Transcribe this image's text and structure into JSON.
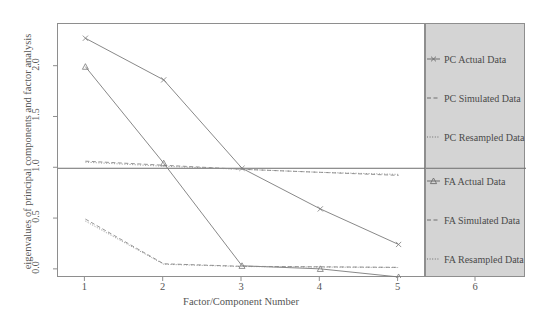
{
  "chart_data": {
    "type": "line",
    "title": "",
    "xlabel": "Factor/Component Number",
    "ylabel": "eigenvalues of principal components and factor analysis",
    "xlim": [
      0.65,
      5.35
    ],
    "ylim": [
      -0.08,
      2.42
    ],
    "xticks": [
      1,
      2,
      3,
      4,
      5
    ],
    "xtick_labels": [
      "1",
      "2",
      "3",
      "4",
      "5"
    ],
    "legend_axis_tick": "6",
    "yticks": [
      0.0,
      0.5,
      1.0,
      1.5,
      2.0
    ],
    "ytick_labels": [
      "0.0",
      "0.5",
      "1.0",
      "1.5",
      "2.0"
    ],
    "grid": false,
    "reference_line": {
      "y": 1.0,
      "style": "solid",
      "color": "#6e6e6e"
    },
    "legend_position": "right",
    "x": [
      1,
      2,
      3,
      4,
      5
    ],
    "series": [
      {
        "name": "PC Actual Data",
        "values": [
          2.28,
          1.87,
          1.0,
          0.6,
          0.25
        ],
        "marker": "x",
        "style": "solid",
        "color": "#7a7a7a"
      },
      {
        "name": "PC Simulated Data",
        "values": [
          1.07,
          1.03,
          0.99,
          0.96,
          0.93
        ],
        "marker": "none",
        "style": "dashed",
        "color": "#8a8a8a"
      },
      {
        "name": "PC Resampled Data",
        "values": [
          1.06,
          1.02,
          0.99,
          0.96,
          0.94
        ],
        "marker": "none",
        "style": "dotted",
        "color": "#8a8a8a"
      },
      {
        "name": "FA Actual Data",
        "values": [
          2.0,
          1.05,
          0.04,
          0.01,
          -0.07
        ],
        "marker": "triangle",
        "style": "solid",
        "color": "#7a7a7a"
      },
      {
        "name": "FA Simulated Data",
        "values": [
          0.5,
          0.06,
          0.035,
          0.03,
          0.025
        ],
        "marker": "none",
        "style": "dashed",
        "color": "#8a8a8a"
      },
      {
        "name": "FA Resampled Data",
        "values": [
          0.48,
          0.055,
          0.033,
          0.028,
          0.023
        ],
        "marker": "none",
        "style": "dotted",
        "color": "#8a8a8a"
      }
    ],
    "legend_entries": [
      {
        "label": "PC Actual Data",
        "marker": "x",
        "style": "solid"
      },
      {
        "label": "PC Simulated Data",
        "marker": "none",
        "style": "dashed"
      },
      {
        "label": "PC Resampled Data",
        "marker": "none",
        "style": "dotted"
      },
      {
        "label": "FA Actual Data",
        "marker": "triangle",
        "style": "solid"
      },
      {
        "label": "FA Simulated Data",
        "marker": "none",
        "style": "dashed"
      },
      {
        "label": "FA Resampled Data",
        "marker": "none",
        "style": "dotted"
      }
    ]
  },
  "colors": {
    "axis": "#8e8e8e",
    "text": "#4a4a4a",
    "line": "#7a7a7a",
    "legend_panel": "#d4d4d4",
    "background": "#ffffff"
  }
}
